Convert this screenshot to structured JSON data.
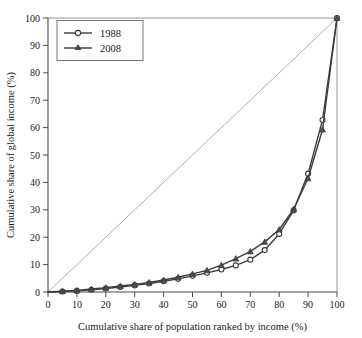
{
  "chart_data": {
    "type": "line",
    "title": "",
    "xlabel": "Cumulative share of population ranked by income (%)",
    "ylabel": "Cumulative share of global income (%)",
    "xlim": [
      0,
      100
    ],
    "ylim": [
      0,
      100
    ],
    "xticks": [
      0,
      10,
      20,
      30,
      40,
      50,
      60,
      70,
      80,
      90,
      100
    ],
    "yticks": [
      0,
      10,
      20,
      30,
      40,
      50,
      60,
      70,
      80,
      90,
      100
    ],
    "xtick_labels": [
      "0",
      "10",
      "20",
      "30",
      "40",
      "50",
      "60",
      "70",
      "80",
      "90",
      "100"
    ],
    "ytick_labels": [
      "0",
      "10",
      "20",
      "30",
      "40",
      "50",
      "60",
      "70",
      "80",
      "90",
      "100"
    ],
    "grid": false,
    "legend_position": "top-left",
    "x": [
      0,
      5,
      10,
      15,
      20,
      25,
      30,
      35,
      40,
      45,
      50,
      55,
      60,
      65,
      70,
      75,
      80,
      85,
      90,
      95,
      100
    ],
    "series": [
      {
        "name": "1988",
        "marker": "open-circle",
        "values": [
          0,
          0.2,
          0.4,
          0.8,
          1.3,
          1.8,
          2.4,
          3.1,
          3.9,
          4.8,
          5.9,
          7.0,
          8.2,
          9.7,
          11.8,
          15.3,
          21.2,
          29.8,
          43.2,
          62.8,
          100
        ]
      },
      {
        "name": "2008",
        "marker": "filled-triangle",
        "values": [
          0,
          0.3,
          0.6,
          1.1,
          1.6,
          2.2,
          2.8,
          3.5,
          4.4,
          5.4,
          6.6,
          7.9,
          9.8,
          12.2,
          14.8,
          18.3,
          22.8,
          30.2,
          41.5,
          59.3,
          100
        ]
      }
    ],
    "reference_line": {
      "name": "line-of-equality",
      "from": [
        0,
        0
      ],
      "to": [
        100,
        100
      ]
    }
  },
  "legend": {
    "entries": [
      {
        "label": "1988"
      },
      {
        "label": "2008"
      }
    ]
  }
}
